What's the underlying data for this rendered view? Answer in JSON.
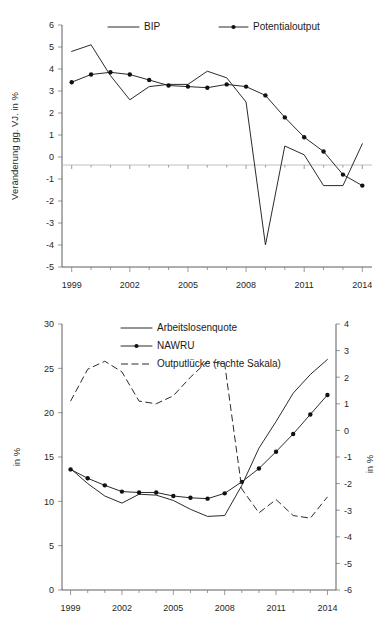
{
  "chart_data": [
    {
      "id": "top",
      "type": "line",
      "title": "",
      "xlabel": "",
      "ylabel": "Veränderung gg. VJ. in %",
      "xlim": [
        1998.5,
        2014.5
      ],
      "ylim": [
        -5,
        6
      ],
      "yticks": [
        6,
        5,
        4,
        3,
        2,
        1,
        0,
        -1,
        -2,
        -3,
        -4,
        -5
      ],
      "xticks": [
        1999,
        2002,
        2005,
        2008,
        2011,
        2014
      ],
      "xticklabels": [
        "1999",
        "2002",
        "2005",
        "2008",
        "2011",
        "2014"
      ],
      "grid": false,
      "zero_line": true,
      "legend_position": "top",
      "x": [
        1999,
        2000,
        2001,
        2002,
        2003,
        2004,
        2005,
        2006,
        2007,
        2008,
        2009,
        2010,
        2011,
        2012,
        2013,
        2014
      ],
      "series": [
        {
          "name": "BIP",
          "style": "plain",
          "markers": false,
          "values": [
            4.8,
            5.1,
            3.7,
            2.6,
            3.2,
            3.3,
            3.3,
            3.9,
            3.6,
            2.5,
            -4.0,
            0.5,
            0.1,
            -1.3,
            -1.3,
            0.6
          ]
        },
        {
          "name": "Potentialoutput",
          "style": "marked",
          "markers": true,
          "values": [
            3.4,
            3.75,
            3.85,
            3.75,
            3.5,
            3.25,
            3.2,
            3.15,
            3.3,
            3.2,
            2.8,
            1.8,
            0.9,
            0.25,
            -0.8,
            -1.3
          ]
        }
      ]
    },
    {
      "id": "bottom",
      "type": "line",
      "title": "",
      "xlabel": "",
      "ylabel": "in %",
      "ylabel_right": "in %",
      "xlim": [
        1998.5,
        2014.5
      ],
      "ylim": [
        0,
        30
      ],
      "ylim_right": [
        -6,
        4
      ],
      "yticks": [
        30,
        25,
        20,
        15,
        10,
        5,
        0
      ],
      "yticks_right": [
        4,
        3,
        2,
        1,
        0,
        -1,
        -2,
        -3,
        -4,
        -5,
        -6
      ],
      "xticks": [
        1999,
        2002,
        2005,
        2008,
        2011,
        2014
      ],
      "xticklabels": [
        "1999",
        "2002",
        "2005",
        "2008",
        "2011",
        "2014"
      ],
      "grid": false,
      "legend_position": "top",
      "x": [
        1999,
        2000,
        2001,
        2002,
        2003,
        2004,
        2005,
        2006,
        2007,
        2008,
        2009,
        2010,
        2011,
        2012,
        2013,
        2014
      ],
      "series": [
        {
          "name": "Arbeitslosenquote",
          "style": "plain",
          "axis": "left",
          "markers": false,
          "values": [
            13.7,
            12.0,
            10.6,
            9.8,
            10.8,
            10.7,
            10.1,
            9.1,
            8.3,
            8.4,
            11.8,
            16.0,
            19.0,
            22.2,
            24.3,
            26.0
          ]
        },
        {
          "name": "NAWRU",
          "style": "marked",
          "axis": "left",
          "markers": true,
          "values": [
            13.6,
            12.6,
            11.8,
            11.1,
            11.0,
            11.0,
            10.6,
            10.4,
            10.3,
            10.9,
            12.2,
            13.7,
            15.6,
            17.6,
            19.8,
            22.0,
            26.0
          ]
        },
        {
          "name": "Outputlücke (rechte Sakala)",
          "style": "dashed",
          "axis": "right",
          "markers": false,
          "values": [
            1.1,
            2.3,
            2.6,
            2.2,
            1.1,
            1.0,
            1.3,
            2.0,
            2.6,
            2.5,
            -2.2,
            -3.1,
            -2.6,
            -3.2,
            -3.3,
            -2.5
          ]
        }
      ]
    }
  ],
  "legends": {
    "top": [
      {
        "label": "BIP",
        "style": "plain"
      },
      {
        "label": "Potentialoutput",
        "style": "marked"
      }
    ],
    "bottom": [
      {
        "label": "Arbeitslosenquote",
        "style": "plain"
      },
      {
        "label": "NAWRU",
        "style": "marked"
      },
      {
        "label": "Outputlücke (rechte Sakala)",
        "style": "dashed"
      }
    ]
  }
}
